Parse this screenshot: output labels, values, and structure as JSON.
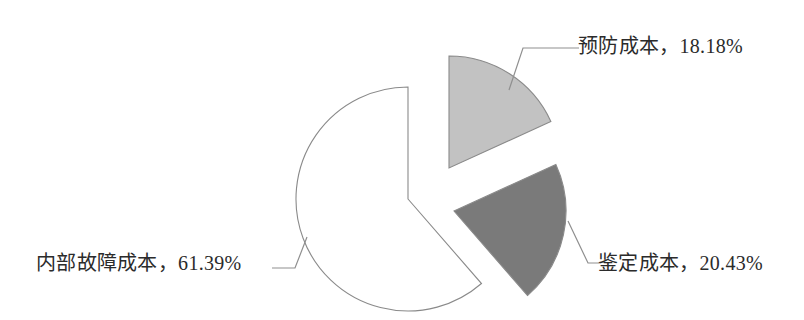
{
  "chart_data": {
    "type": "pie",
    "title": "",
    "subtitle": "",
    "xlabel": "",
    "ylabel": "",
    "legend_position": "none",
    "grid": false,
    "label_format": "{name}，{percent}%",
    "start_angle_deg": 0,
    "direction": "clockwise",
    "categories": [
      "预防成本",
      "鉴定成本",
      "内部故障成本"
    ],
    "values": [
      18.18,
      20.43,
      61.39
    ],
    "units": "%",
    "slices": [
      {
        "name": "预防成本",
        "value": 18.18,
        "value_text": "18.18%",
        "label_text": "预防成本，18.18%",
        "color": "#c2c2c2",
        "outline": "#8a8a8a",
        "exploded": true
      },
      {
        "name": "鉴定成本",
        "value": 20.43,
        "value_text": "20.43%",
        "label_text": "鉴定成本，20.43%",
        "color": "#7a7a7a",
        "outline": "#6f6f6f",
        "exploded": true
      },
      {
        "name": "内部故障成本",
        "value": 61.39,
        "value_text": "61.39%",
        "label_text": "内部故障成本，61.39%",
        "color": "#ffffff",
        "outline": "#8a8a8a",
        "exploded": false
      }
    ]
  },
  "labels": {
    "prevention": "预防成本，18.18%",
    "appraisal": "鉴定成本，20.43%",
    "internal_failure": "内部故障成本，61.39%"
  },
  "colors": {
    "prevention_fill": "#c2c2c2",
    "appraisal_fill": "#7a7a7a",
    "internal_failure_fill": "#ffffff",
    "slice_outline": "#8a8a8a",
    "leader_line": "#8f8f8f",
    "label_text": "#2b2b2b",
    "background": "#ffffff"
  }
}
